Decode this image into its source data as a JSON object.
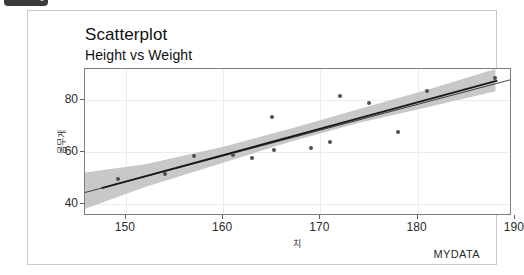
{
  "window": {
    "chrome_bar_label": ""
  },
  "chart_data": {
    "type": "scatter",
    "title": "Scatterplot",
    "subtitle": "Height vs Weight",
    "caption": "MYDATA",
    "xlabel": "치",
    "ylabel": "몸무게",
    "xlim": [
      145.8,
      189.5
    ],
    "ylim": [
      36.0,
      92.0
    ],
    "xticks": [
      150,
      160,
      170,
      180,
      190
    ],
    "yticks": [
      40,
      60,
      80
    ],
    "grid": true,
    "legend": "none",
    "points": [
      {
        "x": 145.0,
        "y": 52.3
      },
      {
        "x": 149.2,
        "y": 49.6
      },
      {
        "x": 154.0,
        "y": 51.3
      },
      {
        "x": 157.0,
        "y": 58.4
      },
      {
        "x": 161.0,
        "y": 58.6
      },
      {
        "x": 163.0,
        "y": 57.5
      },
      {
        "x": 165.0,
        "y": 73.4
      },
      {
        "x": 165.2,
        "y": 60.6
      },
      {
        "x": 169.0,
        "y": 61.6
      },
      {
        "x": 171.0,
        "y": 63.7
      },
      {
        "x": 172.0,
        "y": 81.5
      },
      {
        "x": 175.0,
        "y": 78.7
      },
      {
        "x": 178.0,
        "y": 67.8
      },
      {
        "x": 181.0,
        "y": 83.6
      },
      {
        "x": 188.0,
        "y": 88.6
      }
    ],
    "fit": {
      "type": "linear-regression",
      "x_start": 145.8,
      "y_start": 44.3,
      "x_end": 189.5,
      "y_end": 87.8,
      "band": "95% confidence",
      "band_color": "#c8c8c8",
      "line_color": "#1a1a1a",
      "band_upper": [
        {
          "x": 145.8,
          "y": 52.0
        },
        {
          "x": 152.0,
          "y": 55.2
        },
        {
          "x": 160.0,
          "y": 62.0
        },
        {
          "x": 167.0,
          "y": 69.0
        },
        {
          "x": 174.0,
          "y": 76.6
        },
        {
          "x": 181.0,
          "y": 84.0
        },
        {
          "x": 188.0,
          "y": 92.0
        }
      ],
      "band_lower": [
        {
          "x": 145.8,
          "y": 38.0
        },
        {
          "x": 152.0,
          "y": 46.4
        },
        {
          "x": 160.0,
          "y": 55.8
        },
        {
          "x": 167.0,
          "y": 64.0
        },
        {
          "x": 174.0,
          "y": 71.2
        },
        {
          "x": 181.0,
          "y": 77.2
        },
        {
          "x": 188.0,
          "y": 83.4
        }
      ]
    },
    "point_color": "#4d4d4d"
  }
}
